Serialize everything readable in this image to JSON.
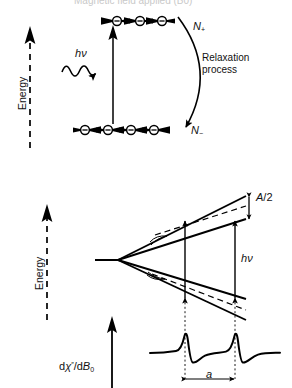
{
  "figure": {
    "title_cropped": "Magnetic field applied (B0)",
    "panels": [
      {
        "name": "spin-population-relaxation",
        "axis_label": "Energy",
        "axis_icon": "up-arrow-dashed-icon",
        "upper_level": {
          "population_label": "N",
          "population_sign": "+",
          "electron_count": 3,
          "spin_direction": "left",
          "electron_icon": "electron-spin-left-icon"
        },
        "lower_level": {
          "population_label": "N",
          "population_sign": "−",
          "electron_count": 4,
          "spin_direction": "right",
          "electron_icon": "electron-spin-right-icon"
        },
        "absorption": {
          "label_h": "h",
          "label_nu": "ν",
          "icon": "wavy-photon-arrow-icon",
          "transition_icon": "up-arrow-icon"
        },
        "relaxation": {
          "line1": "Relaxation",
          "line2": "process",
          "icon": "curved-down-arrow-icon"
        }
      },
      {
        "name": "hyperfine-splitting-and-spectrum",
        "axis_label": "Energy",
        "axis_icon": "up-arrow-dashed-icon",
        "hyperfine_label": {
          "symbol": "A",
          "divisor": "/2",
          "icon": "double-headed-vertical-arrow-icon"
        },
        "transition_label": {
          "label_h": "h",
          "label_nu": "ν",
          "icon": "double-headed-vertical-arrow-icon",
          "count": 2
        },
        "spectrum": {
          "y_axis_label_d": "d",
          "y_axis_label_chi": "χ",
          "y_axis_label_primes": "″",
          "y_axis_label_den": "/d",
          "y_axis_label_B": "B",
          "y_axis_label_B_sub": "0",
          "axis_icon": "up-arrow-icon",
          "line_count": 2,
          "lineshape": "first-derivative",
          "splitting_label": "a",
          "splitting_icon": "double-headed-horizontal-arrow-icon"
        }
      }
    ]
  },
  "colors": {
    "ink": "#000000",
    "background": "#ffffff",
    "faint": "#c9c9c9"
  }
}
